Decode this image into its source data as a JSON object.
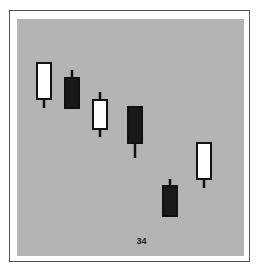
{
  "chart_data": {
    "type": "candlestick",
    "title": "",
    "xlabel": "",
    "ylabel": "",
    "annotation": "34",
    "grid": false,
    "legend": null,
    "axes_visible": false,
    "value_scale_note": "Values are relative chart units (no axis shown); higher = higher price",
    "ylim": [
      0,
      240
    ],
    "colors": {
      "background": "#b3b3b3",
      "bullish_body": "#ffffff",
      "bearish_body": "#1a1a1a",
      "outline": "#111111"
    },
    "candles": [
      {
        "index": 1,
        "type": "bullish",
        "open": 156,
        "high": 194,
        "low": 148,
        "close": 194
      },
      {
        "index": 2,
        "type": "bearish",
        "open": 179,
        "high": 186,
        "low": 147,
        "close": 147
      },
      {
        "index": 3,
        "type": "bullish",
        "open": 126,
        "high": 164,
        "low": 119,
        "close": 157
      },
      {
        "index": 4,
        "type": "bearish",
        "open": 150,
        "high": 150,
        "low": 98,
        "close": 112
      },
      {
        "index": 5,
        "type": "bearish",
        "open": 71,
        "high": 77,
        "low": 39,
        "close": 39
      },
      {
        "index": 6,
        "type": "bullish",
        "open": 76,
        "high": 114,
        "low": 68,
        "close": 114
      }
    ],
    "candle_centers_x": [
      44,
      72,
      100,
      135,
      170,
      204
    ]
  }
}
